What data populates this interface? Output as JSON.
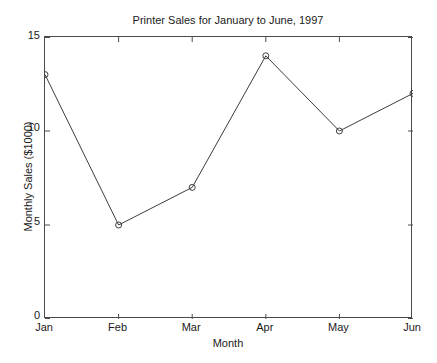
{
  "chart_data": {
    "type": "line",
    "title": "Printer Sales for January to June, 1997",
    "xlabel": "Month",
    "ylabel": "Monthly Sales ($1000)",
    "categories": [
      "Jan",
      "Feb",
      "Mar",
      "Apr",
      "May",
      "Jun"
    ],
    "values": [
      13,
      5,
      7,
      14,
      10,
      12
    ],
    "ylim": [
      0,
      15
    ],
    "yticks": [
      0,
      5,
      10,
      15
    ],
    "ytick_labels": [
      "0",
      "5",
      "10",
      "15"
    ],
    "xticks": [
      "Jan",
      "Feb",
      "Mar",
      "Apr",
      "May",
      "Jun"
    ],
    "grid": false,
    "legend": null,
    "marker": "open-circle",
    "line_color": "#3d3d3d",
    "marker_color": "#3d3d3d",
    "axis_color": "#4a4a4a",
    "background_color": "#ffffff",
    "series": [
      {
        "name": "Monthly Sales",
        "values": [
          13,
          5,
          7,
          14,
          10,
          12
        ],
        "points": [
          {
            "x": "Jan",
            "y": 13
          },
          {
            "x": "Feb",
            "y": 5
          },
          {
            "x": "Mar",
            "y": 7
          },
          {
            "x": "Apr",
            "y": 14
          },
          {
            "x": "May",
            "y": 10
          },
          {
            "x": "Jun",
            "y": 12
          }
        ]
      }
    ]
  }
}
